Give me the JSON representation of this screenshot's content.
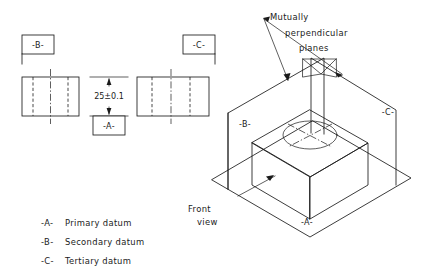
{
  "colors": {
    "line": "#1a1a1a",
    "background": "#ffffff",
    "text": "#1a1a1a"
  },
  "orthographic": {
    "datum_b_label": "-B-",
    "datum_c_label": "-C-",
    "datum_a_label": "-A-",
    "dimension": "25±0.1"
  },
  "isometric": {
    "note_line_1": "Mutually",
    "note_line_2": "perpendicular",
    "note_line_3": "planes",
    "datum_b_label": "-B-",
    "datum_c_label": "-C-",
    "datum_a_label": "-A-",
    "front_view_line_1": "Front",
    "front_view_line_2": "view"
  },
  "legend": {
    "items": [
      {
        "symbol": "-A-",
        "text": "Primary datum"
      },
      {
        "symbol": "-B-",
        "text": "Secondary datum"
      },
      {
        "symbol": "-C-",
        "text": "Tertiary datum"
      }
    ]
  }
}
